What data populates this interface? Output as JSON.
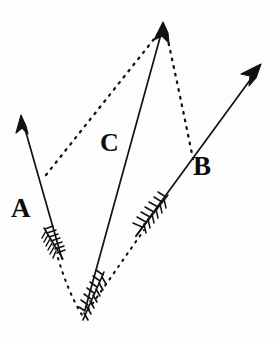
{
  "figure": {
    "kind": "vector-parallelogram-diagram",
    "background_color": "#fdfdfd",
    "ink_color": "#111111",
    "canvas": {
      "width": 280,
      "height": 341
    },
    "labels": [
      {
        "id": "A",
        "text": "A",
        "x": 11,
        "y": 195
      },
      {
        "id": "B",
        "text": "B",
        "x": 193,
        "y": 153
      },
      {
        "id": "C",
        "text": "C",
        "x": 100,
        "y": 130
      }
    ],
    "vectors": [
      {
        "name": "A",
        "label": "A",
        "tail": {
          "x": 62,
          "y": 259
        },
        "head": {
          "x": 21,
          "y": 117
        },
        "has_fletching": true,
        "style": "solid"
      },
      {
        "name": "B",
        "label": "B",
        "tail": {
          "x": 136,
          "y": 236
        },
        "head": {
          "x": 259,
          "y": 68
        },
        "has_fletching": true,
        "style": "solid"
      },
      {
        "name": "C",
        "label": "C",
        "tail": {
          "x": 83,
          "y": 316
        },
        "head": {
          "x": 162,
          "y": 26
        },
        "has_fletching": true,
        "style": "solid"
      }
    ],
    "construction_lines": [
      {
        "name": "dotted-A-to-C-head",
        "from": {
          "x": 46,
          "y": 175
        },
        "to": {
          "x": 159,
          "y": 33
        },
        "style": "dotted"
      },
      {
        "name": "dotted-C-head-to-B",
        "from": {
          "x": 166,
          "y": 35
        },
        "to": {
          "x": 192,
          "y": 160
        },
        "style": "dotted"
      },
      {
        "name": "dotted-C-tail-to-B-fletching",
        "from": {
          "x": 86,
          "y": 312
        },
        "to": {
          "x": 142,
          "y": 232
        },
        "style": "dotted"
      },
      {
        "name": "dotted-A-fletching-to-C-tail",
        "from": {
          "x": 59,
          "y": 262
        },
        "to": {
          "x": 84,
          "y": 314
        },
        "style": "dotted"
      }
    ]
  }
}
